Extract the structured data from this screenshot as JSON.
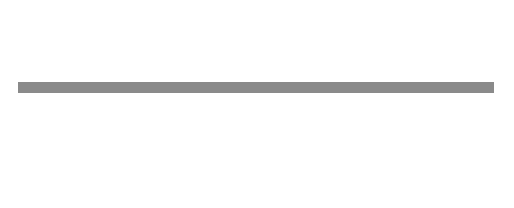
{
  "setups": [
    {
      "label": "Set-Up 1",
      "columns": [
        5
      ],
      "bottom": [
        "grey"
      ]
    },
    {
      "label": "Set-Up 2",
      "columns": [
        5
      ],
      "bottom": [
        "white",
        "grey",
        "white"
      ],
      "bottom_orientation": "vertical-stack"
    },
    {
      "label": "Set-Up 3",
      "columns": [
        5,
        5
      ],
      "bottom": [
        "grey",
        "white"
      ]
    },
    {
      "label": "Set-Up 4",
      "columns": [
        5,
        0,
        5
      ],
      "bottom": [
        "grey",
        "gap",
        "white"
      ]
    },
    {
      "label": "Set-Up 5",
      "columns": [
        5,
        4
      ],
      "bottom": [
        "grey",
        "white"
      ]
    },
    {
      "label": "Set-Up 6",
      "columns": [
        5,
        4,
        3,
        2,
        1
      ],
      "bottom": [
        "grey",
        "white",
        "white",
        "white",
        "white"
      ]
    },
    {
      "label": "Set-Up 7",
      "columns": [
        5,
        2,
        3,
        4,
        1
      ],
      "bottom": [
        "grey",
        "white",
        "white",
        "white",
        "white"
      ]
    }
  ],
  "setup2_marks": [
    "a°",
    "a°",
    "a°"
  ],
  "colors": {
    "shaded": "#7a7a7a",
    "ground": "#8a8a8a",
    "outline": "#555555"
  }
}
